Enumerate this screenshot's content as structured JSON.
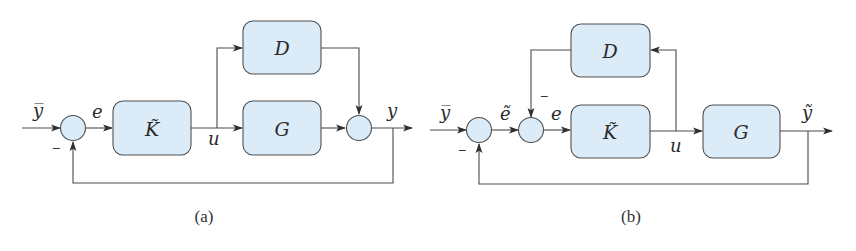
{
  "colors": {
    "block_fill": "#dcebf8",
    "stroke": "#505050",
    "text": "#2a2a2a",
    "background": "#ffffff"
  },
  "diagram_a": {
    "caption": "(a)",
    "blocks": [
      {
        "id": "K",
        "label": "K̃"
      },
      {
        "id": "D",
        "label": "D"
      },
      {
        "id": "G",
        "label": "G"
      }
    ],
    "signals": {
      "input": "y̅",
      "error": "e",
      "control": "u",
      "output": "y"
    },
    "feedback_sign": "−",
    "summing_junctions": 2
  },
  "diagram_b": {
    "caption": "(b)",
    "blocks": [
      {
        "id": "D",
        "label": "D"
      },
      {
        "id": "K",
        "label": "K̃"
      },
      {
        "id": "G",
        "label": "G"
      }
    ],
    "signals": {
      "input": "y̅",
      "error_tilde": "ẽ",
      "error": "e",
      "control": "u",
      "output": "ỹ"
    },
    "feedback_sign": "−",
    "inner_feedback_sign": "−",
    "summing_junctions": 2
  }
}
